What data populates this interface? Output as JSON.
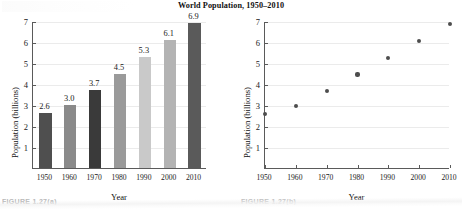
{
  "figure": {
    "title": "World Population, 1950–2010",
    "captions": {
      "left": "FIGURE 1.27(a)",
      "right": "FIGURE 1.27(b)"
    }
  },
  "chart_data": [
    {
      "type": "bar",
      "title": "World Population, 1950–2010",
      "xlabel": "Year",
      "ylabel": "Population (billions)",
      "categories": [
        "1950",
        "1960",
        "1970",
        "1980",
        "1990",
        "2000",
        "2010"
      ],
      "values": [
        2.6,
        3.0,
        3.7,
        4.5,
        5.3,
        6.1,
        6.9
      ],
      "value_labels": [
        "2.6",
        "3.0",
        "3.7",
        "4.5",
        "5.3",
        "6.1",
        "6.9"
      ],
      "bar_colors": [
        "#4f4f4f",
        "#8a8a8a",
        "#3a3a3a",
        "#9a9a9a",
        "#c9c9c9",
        "#b3b3b3",
        "#5a5a5a"
      ],
      "ylim": [
        0,
        7
      ],
      "yticks": [
        1,
        2,
        3,
        4,
        5,
        6,
        7
      ],
      "ytick_labels": [
        "1",
        "2",
        "3",
        "4",
        "5",
        "6",
        "7"
      ],
      "grid": true,
      "legend": "none"
    },
    {
      "type": "scatter",
      "xlabel": "Year",
      "ylabel": "Population (billions)",
      "x": [
        1950,
        1960,
        1970,
        1980,
        1990,
        2000,
        2010
      ],
      "y": [
        2.6,
        3.0,
        3.7,
        4.5,
        5.3,
        6.1,
        6.9
      ],
      "xtick_labels": [
        "1950",
        "1960",
        "1970",
        "1980",
        "1990",
        "2000",
        "2010"
      ],
      "xlim": [
        1950,
        2010
      ],
      "ylim": [
        0,
        7
      ],
      "yticks": [
        1,
        2,
        3,
        4,
        5,
        6,
        7
      ],
      "ytick_labels": [
        "1",
        "2",
        "3",
        "4",
        "5",
        "6",
        "7"
      ],
      "marker_color": "#4d4d4d",
      "grid": true,
      "legend": "none"
    }
  ]
}
